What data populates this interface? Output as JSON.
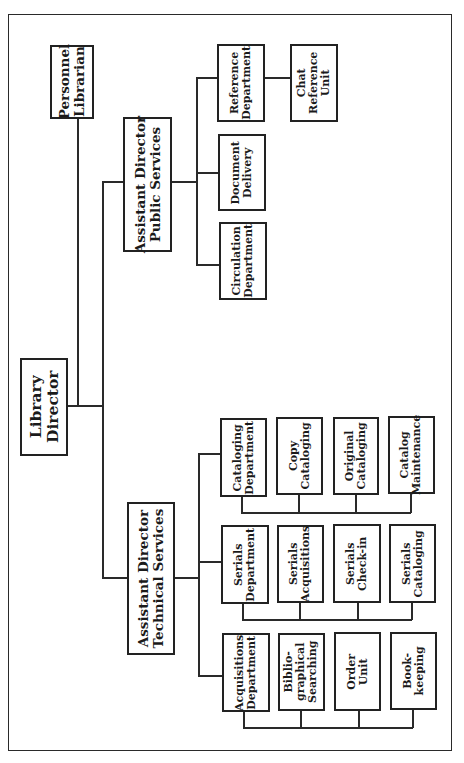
{
  "chart": {
    "orientation": "rotated-90-ccw",
    "line_color": "#2a2a2a",
    "root": {
      "label": "Library\nDirector",
      "staff": {
        "label": "Personnel\nLibrarian"
      },
      "divisions": [
        {
          "label": "Assistant Director\nPublic Services",
          "units": [
            {
              "label": "Reference\nDepartment",
              "children": [
                {
                  "label": "Chat\nReference\nUnit"
                }
              ]
            },
            {
              "label": "Document\nDelivery"
            },
            {
              "label": "Circulation\nDepartment"
            }
          ]
        },
        {
          "label": "Assistant Director\nTechnical Services",
          "departments": [
            {
              "label": "Cataloging\nDepartment",
              "sections": [
                {
                  "label": "Copy\nCataloging"
                },
                {
                  "label": "Original\nCataloging"
                },
                {
                  "label": "Catalog\nMaintenance"
                }
              ]
            },
            {
              "label": "Serials\nDepartment",
              "sections": [
                {
                  "label": "Serials\nAcquisitions"
                },
                {
                  "label": "Serials\nCheck-in"
                },
                {
                  "label": "Serials\nCataloging"
                }
              ]
            },
            {
              "label": "Acquisitions\nDepartment",
              "sections": [
                {
                  "label": "Biblio-\ngraphical\nSearching"
                },
                {
                  "label": "Order\nUnit"
                },
                {
                  "label": "Book-\nkeeping"
                }
              ]
            }
          ]
        }
      ]
    }
  }
}
